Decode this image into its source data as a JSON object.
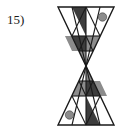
{
  "page": {
    "background_color": "#ffffff",
    "width": 125,
    "height": 132
  },
  "item": {
    "number_label": "15)"
  },
  "figure": {
    "name": "hourglass-bowtie-triangles",
    "symmetry": "180-degree rotational",
    "colors": {
      "outline": "#1a1a1a",
      "dark_fill": "#3d3d3d",
      "gray_fill": "#8c8c8c",
      "light_gray_fill": "#b3b3b3",
      "white_fill": "#ffffff",
      "dot_fill": "#8c8c8c"
    },
    "geometry": {
      "left": 3,
      "right": 59,
      "top": 3,
      "bottom": 121,
      "center_x": 31,
      "center_y": 62,
      "top_triangle": {
        "apex_x": 31,
        "apex_y": 62,
        "base_left_x": 3,
        "base_right_x": 59,
        "base_y": 3
      },
      "bottom_triangle": {
        "apex_x": 31,
        "apex_y": 62,
        "base_left_x": 3,
        "base_right_x": 59,
        "base_y": 121
      }
    },
    "dots": [
      {
        "name": "dot-top-right",
        "cx": 47.5,
        "cy": 13,
        "r": 4.2,
        "fill": "#8c8c8c"
      },
      {
        "name": "dot-bottom-left",
        "cx": 14.5,
        "cy": 111,
        "r": 4.2,
        "fill": "#8c8c8c"
      }
    ]
  }
}
